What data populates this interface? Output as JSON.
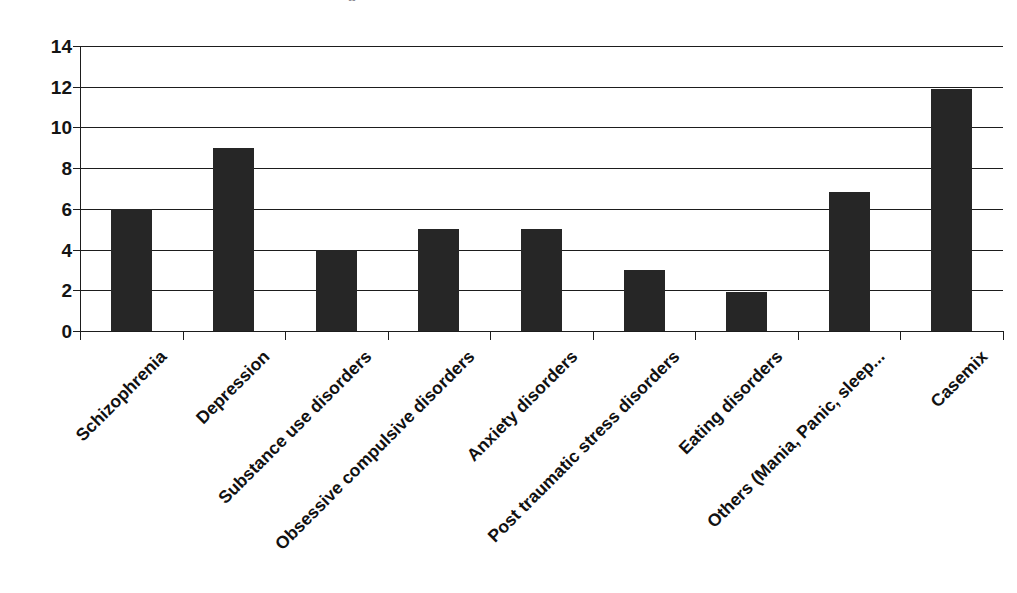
{
  "figure": {
    "title_remnant": "g",
    "background_color": "#ffffff",
    "bar_color": "#262626",
    "axis_color": "#1d1d1d",
    "label_color": "#111111"
  },
  "chart_data": {
    "type": "bar",
    "title": "",
    "xlabel": "",
    "ylabel": "",
    "ylim": [
      0,
      14
    ],
    "yticks": [
      0,
      2,
      4,
      6,
      8,
      10,
      12,
      14
    ],
    "ytick_labels": [
      "0",
      "2",
      "4",
      "6",
      "8",
      "10",
      "12",
      "14"
    ],
    "grid": true,
    "legend": false,
    "x_tick_label_rotation": -45,
    "categories": [
      "Schizophrenia",
      "Depression",
      "Substance use disorders",
      "Obsessive compulsive disorders",
      "Anxiety disorders",
      "Post traumatic stress disorders",
      "Eating disorders",
      "Others (Mania, Panic, sleep...",
      "Casemix"
    ],
    "values": [
      6,
      9,
      4,
      5,
      5,
      3,
      1.9,
      6.85,
      11.9
    ]
  }
}
